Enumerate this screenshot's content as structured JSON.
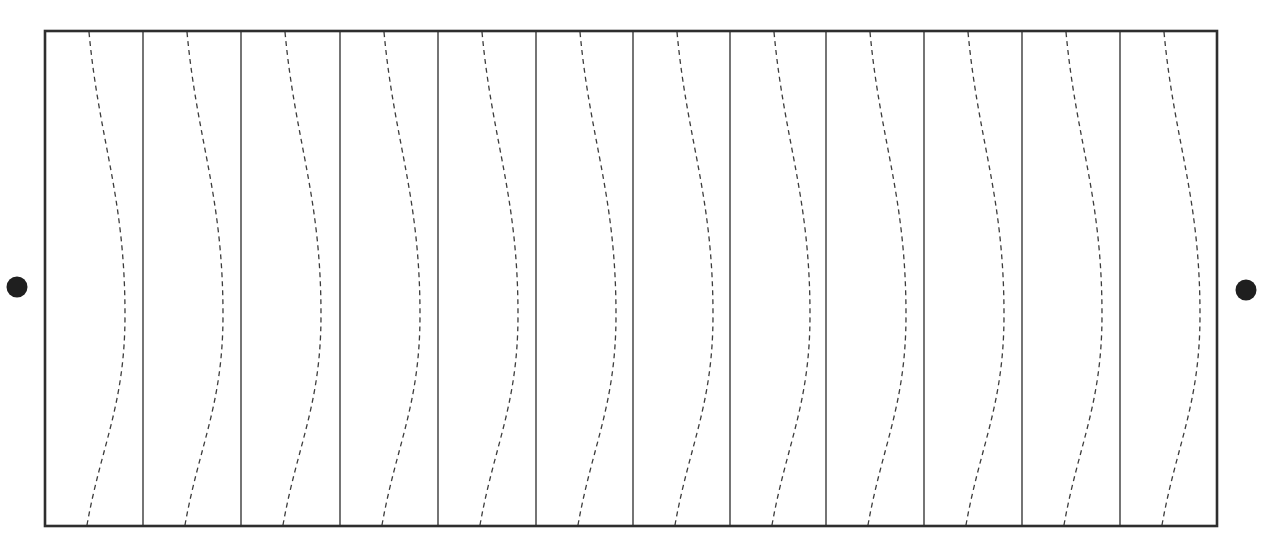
{
  "diagram": {
    "canvas": {
      "width": 1275,
      "height": 554
    },
    "frame": {
      "x": 45,
      "y": 31,
      "width": 1172,
      "height": 495,
      "stroke": "#2e2e2e"
    },
    "cell_count": 12,
    "dividers_x": [
      143,
      241,
      340,
      438,
      536,
      633,
      730,
      826,
      924,
      1022,
      1120
    ],
    "cells_left_x": [
      45,
      143,
      241,
      340,
      438,
      536,
      633,
      730,
      826,
      924,
      1022,
      1120
    ],
    "curve": {
      "style": "dashed",
      "dash": [
        5,
        4
      ],
      "color": "#3c3c3c",
      "top_offset": 44,
      "peak_offset": 80,
      "peak_y": 315,
      "bottom_offset": 42
    },
    "terminals": [
      {
        "name": "left-terminal",
        "cx": 17,
        "cy": 287,
        "r": 10.5,
        "color": "#1f1f1f"
      },
      {
        "name": "right-terminal",
        "cx": 1246,
        "cy": 290,
        "r": 10.5,
        "color": "#1f1f1f"
      }
    ]
  }
}
